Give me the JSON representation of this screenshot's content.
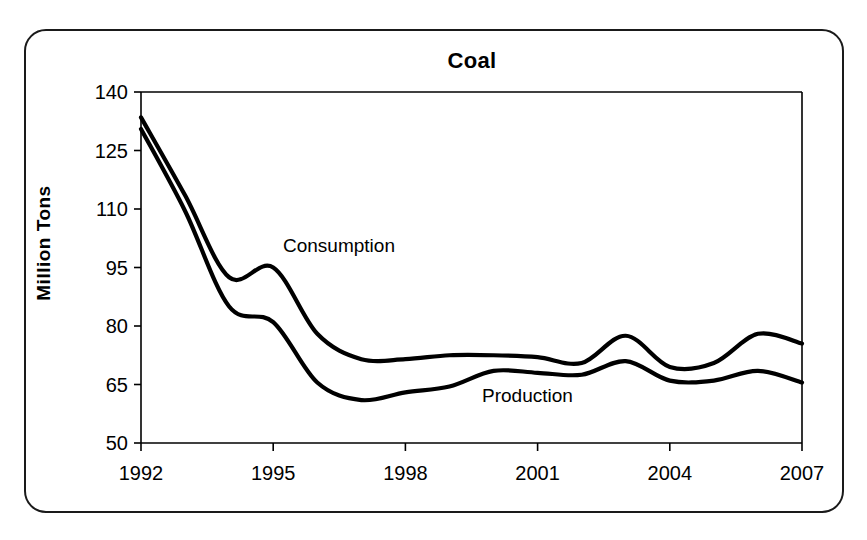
{
  "card": {
    "border_color": "#1a1a1a"
  },
  "chart_data": {
    "type": "line",
    "title": "Coal",
    "xlabel": "",
    "ylabel": "Million Tons",
    "xlim": [
      1992,
      2007
    ],
    "ylim": [
      50,
      140
    ],
    "grid": false,
    "legend_position": "inline-annotation",
    "x_ticks": [
      "1992",
      "1995",
      "1998",
      "2001",
      "2004",
      "2007"
    ],
    "x_tick_values": [
      1992,
      1995,
      1998,
      2001,
      2004,
      2007
    ],
    "y_ticks": [
      "50",
      "65",
      "80",
      "95",
      "110",
      "125",
      "140"
    ],
    "y_tick_values": [
      50,
      65,
      80,
      95,
      110,
      125,
      140
    ],
    "x": [
      1992,
      1993,
      1994,
      1995,
      1996,
      1997,
      1998,
      1999,
      2000,
      2001,
      2002,
      2003,
      2004,
      2005,
      2006,
      2007
    ],
    "series": [
      {
        "name": "Consumption",
        "label_text": "Consumption",
        "color": "#000000",
        "values": [
          133.5,
          113.5,
          92.5,
          95.0,
          78.0,
          71.5,
          71.5,
          72.5,
          72.5,
          72.0,
          70.5,
          77.5,
          69.5,
          70.5,
          78.0,
          75.5
        ]
      },
      {
        "name": "Production",
        "label_text": "Production",
        "color": "#000000",
        "values": [
          130.5,
          109.5,
          85.0,
          81.0,
          65.5,
          61.0,
          63.0,
          64.5,
          68.5,
          68.0,
          67.5,
          71.0,
          66.0,
          66.0,
          68.5,
          65.5
        ]
      }
    ],
    "annotations": [
      {
        "text": "Consumption",
        "x_px": 283,
        "y_px": 236
      },
      {
        "text": "Production",
        "x_px": 482,
        "y_px": 386
      }
    ]
  }
}
